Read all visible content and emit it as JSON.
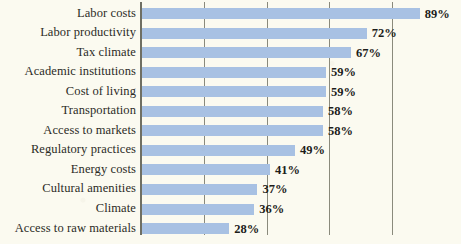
{
  "chart_data": {
    "type": "bar",
    "orientation": "horizontal",
    "title": "",
    "subtitle": "",
    "xlabel": "",
    "ylabel": "",
    "xlim": [
      0,
      100
    ],
    "grid": true,
    "gridline_values": [
      20,
      40,
      60,
      80
    ],
    "legend": "none",
    "value_label_suffix": "%",
    "bar_color": "#a8c1e3",
    "background_color": "#fbfaf0",
    "axis_color": "#6f6f63",
    "categories": [
      "Labor costs",
      "Labor productivity",
      "Tax climate",
      "Academic institutions",
      "Cost of living",
      "Transportation",
      "Access to markets",
      "Regulatory practices",
      "Energy costs",
      "Cultural amenities",
      "Climate",
      "Access to raw materials"
    ],
    "values": [
      89,
      72,
      67,
      59,
      59,
      58,
      58,
      49,
      41,
      37,
      36,
      28
    ],
    "value_labels": [
      "89%",
      "72%",
      "67%",
      "59%",
      "59%",
      "58%",
      "58%",
      "49%",
      "41%",
      "37%",
      "36%",
      "28%"
    ]
  }
}
